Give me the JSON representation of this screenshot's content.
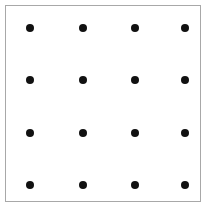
{
  "figure": {
    "title": "",
    "background_color": "#ffffff",
    "canvas": {
      "width": 211,
      "height": 216
    },
    "frame": {
      "name": "bounding-rectangle",
      "x": 5,
      "y": 5,
      "width": 196,
      "height": 197,
      "stroke_color": "#a8a8a8",
      "stroke_width": 1,
      "fill_color": "#ffffff"
    }
  },
  "chart_data": {
    "type": "scatter",
    "title": "",
    "xlabel": "",
    "ylabel": "",
    "grid": false,
    "legend": null,
    "marker": {
      "shape": "circle",
      "color": "#111111",
      "diameter_px": 8
    },
    "rows": 4,
    "columns": 4,
    "x": [
      30,
      83,
      135,
      185
    ],
    "y": [
      28,
      80,
      133,
      185
    ],
    "xlim": [
      5,
      201
    ],
    "ylim": [
      5,
      202
    ],
    "points": [
      {
        "cx": 30,
        "cy": 28,
        "row": 1,
        "col": 1
      },
      {
        "cx": 83,
        "cy": 28,
        "row": 1,
        "col": 2
      },
      {
        "cx": 135,
        "cy": 28,
        "row": 1,
        "col": 3
      },
      {
        "cx": 185,
        "cy": 28,
        "row": 1,
        "col": 4
      },
      {
        "cx": 30,
        "cy": 80,
        "row": 2,
        "col": 1
      },
      {
        "cx": 83,
        "cy": 80,
        "row": 2,
        "col": 2
      },
      {
        "cx": 135,
        "cy": 80,
        "row": 2,
        "col": 3
      },
      {
        "cx": 185,
        "cy": 80,
        "row": 2,
        "col": 4
      },
      {
        "cx": 30,
        "cy": 133,
        "row": 3,
        "col": 1
      },
      {
        "cx": 83,
        "cy": 133,
        "row": 3,
        "col": 2
      },
      {
        "cx": 135,
        "cy": 133,
        "row": 3,
        "col": 3
      },
      {
        "cx": 185,
        "cy": 133,
        "row": 3,
        "col": 4
      },
      {
        "cx": 30,
        "cy": 185,
        "row": 4,
        "col": 1
      },
      {
        "cx": 83,
        "cy": 185,
        "row": 4,
        "col": 2
      },
      {
        "cx": 135,
        "cy": 185,
        "row": 4,
        "col": 3
      },
      {
        "cx": 185,
        "cy": 185,
        "row": 4,
        "col": 4
      }
    ]
  }
}
